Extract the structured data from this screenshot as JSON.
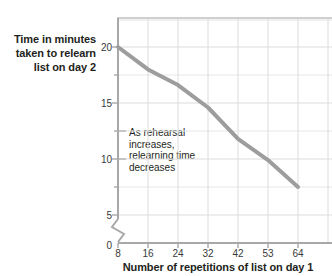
{
  "chart_data": {
    "type": "line",
    "title": "",
    "xlabel": "Number of repetitions of list on day 1",
    "ylabel_lines": [
      "Time in minutes",
      "taken to relearn",
      "list on day 2"
    ],
    "ylabel": "Time in minutes taken to relearn list on day 2",
    "x_tick_labels": [
      "8",
      "16",
      "24",
      "32",
      "42",
      "53",
      "64"
    ],
    "y_tick_labels": [
      "0",
      "5",
      "10",
      "15",
      "20"
    ],
    "x": [
      8,
      16,
      24,
      32,
      42,
      53,
      64
    ],
    "values": [
      20,
      18,
      16.6,
      14.6,
      11.8,
      9.9,
      7.5
    ],
    "series": [
      {
        "name": "Relearning time",
        "values": [
          20,
          18,
          16.6,
          14.6,
          11.8,
          9.9,
          7.5
        ]
      }
    ],
    "xlim": [
      8,
      64
    ],
    "ylim": [
      0,
      22.5
    ],
    "y_axis_break": true,
    "y_axis_break_between": [
      0,
      5
    ],
    "grid": true,
    "legend": "none",
    "line_color": "#9d9d9d",
    "grid_color": "#d9d9d9",
    "axis_color": "#a8a8a8",
    "text_color": "#231f20",
    "annotations": [
      {
        "text": "As rehearsal increases, relearning time decreases",
        "lines": [
          "As rehearsal",
          "increases,",
          "relearning time",
          "decreases"
        ],
        "x": 24,
        "y": 12.5
      }
    ]
  }
}
